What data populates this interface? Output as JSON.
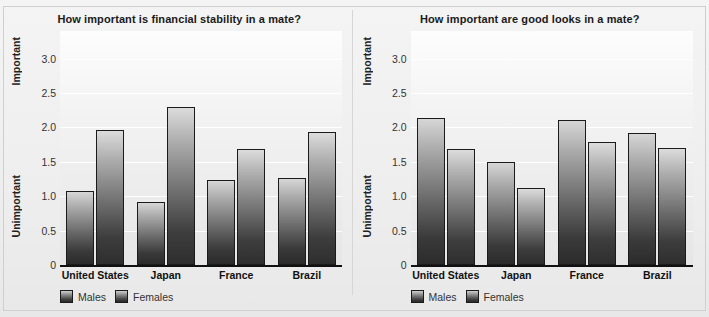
{
  "figure": {
    "background_color": "#f0f0f0",
    "bar_colors": {
      "males": "#4a4a4a",
      "females": "#555555"
    },
    "axis_top_label": "Important",
    "axis_bottom_label": "Unimportant",
    "legend": [
      {
        "key": "males",
        "label": "Males"
      },
      {
        "key": "females",
        "label": "Females"
      }
    ]
  },
  "chart_data": [
    {
      "type": "bar",
      "title": "How important is financial stability in a mate?",
      "xlabel": "",
      "ylabel": "",
      "ylim": [
        0,
        3.4
      ],
      "yticks": [
        "0",
        "0.5",
        "1.0",
        "1.5",
        "2.0",
        "2.5",
        "3.0"
      ],
      "ytick_values": [
        0,
        0.5,
        1.0,
        1.5,
        2.0,
        2.5,
        3.0
      ],
      "y_axis_top_annotation": "Important",
      "y_axis_bottom_annotation": "Unimportant",
      "grid": true,
      "legend_position": "below-left",
      "categories": [
        "United States",
        "Japan",
        "France",
        "Brazil"
      ],
      "series": [
        {
          "name": "Males",
          "values": [
            1.07,
            0.92,
            1.23,
            1.26
          ]
        },
        {
          "name": "Females",
          "values": [
            1.96,
            2.3,
            1.69,
            1.93
          ]
        }
      ]
    },
    {
      "type": "bar",
      "title": "How important are good looks in a mate?",
      "xlabel": "",
      "ylabel": "",
      "ylim": [
        0,
        3.4
      ],
      "yticks": [
        "0",
        "0.5",
        "1.0",
        "1.5",
        "2.0",
        "2.5",
        "3.0"
      ],
      "ytick_values": [
        0,
        0.5,
        1.0,
        1.5,
        2.0,
        2.5,
        3.0
      ],
      "y_axis_top_annotation": "Important",
      "y_axis_bottom_annotation": "Unimportant",
      "grid": true,
      "legend_position": "below-left",
      "categories": [
        "United States",
        "Japan",
        "France",
        "Brazil"
      ],
      "series": [
        {
          "name": "Males",
          "values": [
            2.14,
            1.5,
            2.11,
            1.92
          ]
        },
        {
          "name": "Females",
          "values": [
            1.69,
            1.12,
            1.79,
            1.7
          ]
        }
      ]
    }
  ]
}
